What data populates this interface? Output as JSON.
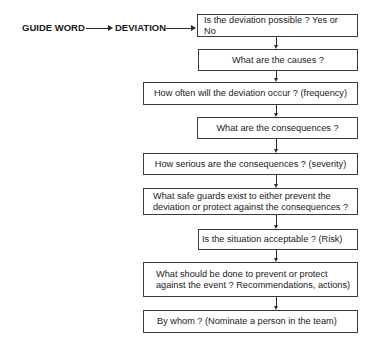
{
  "header": {
    "guide_word": "GUIDE WORD",
    "deviation": "DEVIATION"
  },
  "steps": [
    {
      "id": 1,
      "text": "Is the deviation possible ?  Yes or No"
    },
    {
      "id": 2,
      "text": "What are the causes ?"
    },
    {
      "id": 3,
      "text": "How often will the deviation occur ? (frequency)"
    },
    {
      "id": 4,
      "text": "What are the consequences ?"
    },
    {
      "id": 5,
      "text": "How serious are the consequences ? (severity)"
    },
    {
      "id": 6,
      "text": "What safe guards exist to either prevent the\ndeviation or protect against the consequences ?"
    },
    {
      "id": 7,
      "text": "Is the situation acceptable ? (Risk)"
    },
    {
      "id": 8,
      "text": "What should be done to prevent or protect\n against the event ? Recommendations, actions)"
    },
    {
      "id": 9,
      "text": "By whom ? (Nominate a person in the team)"
    }
  ],
  "colors": {
    "line": "#2a2a2a",
    "border": "#3a3a3a",
    "text": "#1a1a1a",
    "background": "#ffffff"
  }
}
